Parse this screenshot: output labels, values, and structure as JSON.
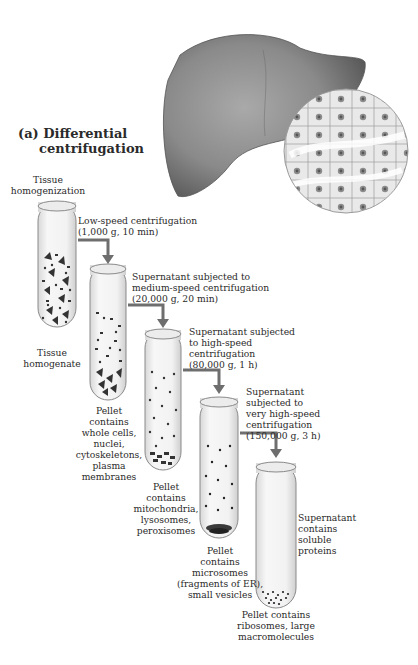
{
  "figure": {
    "title_prefix": "(a)",
    "title_line1": "Differential",
    "title_line2": "centrifugation",
    "liver": {
      "label": "liver-illustration",
      "color": "#7a7a7a"
    },
    "hepatocyte_inset": {
      "label": "liver-cells-magnified"
    },
    "arrow_color": "#6e6e6e",
    "tubes": [
      {
        "top_label": [
          "Tissue",
          "homogenization"
        ],
        "bottom_label": [
          "Tissue",
          "homogenate"
        ]
      },
      {
        "step": [
          "Low-speed centrifugation",
          "(1,000 g, 10 min)"
        ],
        "pellet_label": [
          "Pellet",
          "contains",
          "whole cells,",
          "nuclei,",
          "cytoskeletons,",
          "plasma",
          "membranes"
        ]
      },
      {
        "step": [
          "Supernatant subjected to",
          "medium-speed centrifugation",
          "(20,000 g, 20 min)"
        ],
        "pellet_label": [
          "Pellet",
          "contains",
          "mitochondria,",
          "lysosomes,",
          "peroxisomes"
        ]
      },
      {
        "step": [
          "Supernatant subjected",
          "to high-speed",
          "centrifugation",
          "(80,000 g, 1 h)"
        ],
        "pellet_label": [
          "Pellet",
          "contains",
          "microsomes",
          "(fragments of ER),",
          "small vesicles"
        ]
      },
      {
        "step": [
          "Supernatant",
          "subjected to",
          "very high-speed",
          "centrifugation",
          "(150,000 g, 3 h)"
        ],
        "supernatant_label": [
          "Supernatant",
          "contains",
          "soluble",
          "proteins"
        ],
        "pellet_label": [
          "Pellet contains",
          "ribosomes, large",
          "macromolecules"
        ]
      }
    ]
  }
}
